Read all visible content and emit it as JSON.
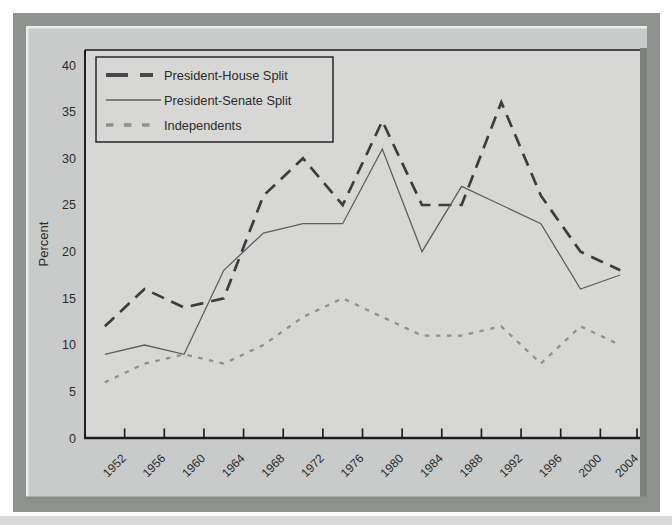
{
  "figure": {
    "ylabel": "Percent",
    "colors": {
      "page_bg": "#ffffff",
      "mat_band": "#8f918f",
      "panel_bg": "#c9cbca",
      "panel_highlight": "#ebedeb",
      "panel_shadow": "#7d807d",
      "plot_bg": "#d7d8d5",
      "axis": "#1d1d1d",
      "bottom_strip": "#d9dad8"
    }
  },
  "chart_data": {
    "type": "line",
    "title": "",
    "xlabel": "",
    "ylabel": "Percent",
    "categories": [
      "1952",
      "1956",
      "1960",
      "1964",
      "1968",
      "1972",
      "1976",
      "1980",
      "1984",
      "1988",
      "1992",
      "1996",
      "2000",
      "2004"
    ],
    "series": [
      {
        "name": "President-House Split",
        "style": "long-dash",
        "color": "#3b3d3c",
        "values": [
          12,
          16,
          14,
          15,
          26,
          30,
          25,
          34,
          25,
          25,
          36,
          26,
          20,
          18
        ]
      },
      {
        "name": "President-Senate Split",
        "style": "solid",
        "color": "#5c5e5d",
        "values": [
          9,
          10,
          9,
          18,
          22,
          23,
          23,
          31,
          20,
          27,
          25,
          23,
          16,
          17.5
        ]
      },
      {
        "name": "Independents",
        "style": "short-dash",
        "color": "#8e908e",
        "values": [
          6,
          8,
          9,
          8,
          10,
          13,
          15,
          13,
          11,
          11,
          12,
          8,
          12,
          10
        ]
      }
    ],
    "ylim": [
      0,
      40
    ],
    "yticks": [
      0,
      5,
      10,
      15,
      20,
      25,
      30,
      35,
      40
    ],
    "grid": false,
    "legend_position": "top-left"
  }
}
